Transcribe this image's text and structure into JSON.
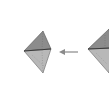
{
  "diagram": {
    "type": "geometric-transformation",
    "shapes": [
      {
        "id": "left-bipyramid",
        "upper_face_color": "#8c8c8c",
        "lower_face_color": "#b8b8b8",
        "edge_color": "#333333"
      },
      {
        "id": "right-bipyramid-cropped",
        "upper_face_color": "#8c8c8c",
        "lower_face_color": "#b8b8b8",
        "edge_color": "#333333"
      }
    ],
    "arrow": {
      "direction": "left",
      "color": "#9a9a9a"
    },
    "background": "#ffffff"
  }
}
